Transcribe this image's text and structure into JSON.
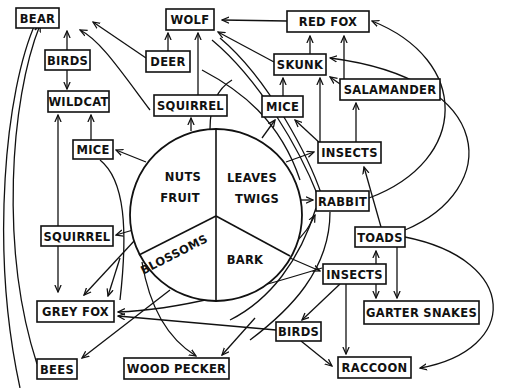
{
  "diagram": {
    "type": "food-web",
    "center": {
      "cx": 216,
      "cy": 215,
      "r": 86,
      "segments": [
        {
          "id": "nuts_fruit",
          "lines": [
            "NUTS",
            "FRUIT"
          ]
        },
        {
          "id": "leaves_twigs",
          "lines": [
            "LEAVES",
            "TWIGS"
          ]
        },
        {
          "id": "blossoms",
          "lines": [
            "BLOSSOMS"
          ]
        },
        {
          "id": "bark",
          "lines": [
            "BARK"
          ]
        }
      ]
    },
    "nodes": [
      {
        "id": "bear",
        "label": "BEAR",
        "x": 16,
        "y": 8,
        "w": 43,
        "h": 20
      },
      {
        "id": "wolf",
        "label": "WOLF",
        "x": 166,
        "y": 9,
        "w": 48,
        "h": 21
      },
      {
        "id": "red_fox",
        "label": "RED FOX",
        "x": 287,
        "y": 11,
        "w": 82,
        "h": 21
      },
      {
        "id": "birds_top",
        "label": "BIRDS",
        "x": 45,
        "y": 50,
        "w": 45,
        "h": 20
      },
      {
        "id": "deer",
        "label": "DEER",
        "x": 146,
        "y": 51,
        "w": 44,
        "h": 21
      },
      {
        "id": "skunk",
        "label": "SKUNK",
        "x": 274,
        "y": 54,
        "w": 52,
        "h": 21
      },
      {
        "id": "salamander",
        "label": "SALAMANDER",
        "x": 340,
        "y": 79,
        "w": 100,
        "h": 21
      },
      {
        "id": "wildcat",
        "label": "WILDCAT",
        "x": 48,
        "y": 91,
        "w": 61,
        "h": 21
      },
      {
        "id": "squirrel_top",
        "label": "SQUIRREL",
        "x": 154,
        "y": 95,
        "w": 73,
        "h": 21
      },
      {
        "id": "mice_top",
        "label": "MICE",
        "x": 262,
        "y": 96,
        "w": 41,
        "h": 21
      },
      {
        "id": "mice_left",
        "label": "MICE",
        "x": 73,
        "y": 140,
        "w": 40,
        "h": 19
      },
      {
        "id": "insects_top",
        "label": "INSECTS",
        "x": 318,
        "y": 142,
        "w": 63,
        "h": 21
      },
      {
        "id": "rabbit",
        "label": "RABBIT",
        "x": 316,
        "y": 191,
        "w": 53,
        "h": 20
      },
      {
        "id": "squirrel_left",
        "label": "SQUIRREL",
        "x": 41,
        "y": 226,
        "w": 72,
        "h": 20
      },
      {
        "id": "toads",
        "label": "TOADS",
        "x": 355,
        "y": 227,
        "w": 50,
        "h": 20
      },
      {
        "id": "insects_bottom",
        "label": "INSECTS",
        "x": 323,
        "y": 264,
        "w": 63,
        "h": 20
      },
      {
        "id": "grey_fox",
        "label": "GREY FOX",
        "x": 37,
        "y": 301,
        "w": 77,
        "h": 21
      },
      {
        "id": "garter_snakes",
        "label": "GARTER SNAKES",
        "x": 364,
        "y": 301,
        "w": 115,
        "h": 23
      },
      {
        "id": "birds_bottom",
        "label": "BIRDS",
        "x": 276,
        "y": 322,
        "w": 45,
        "h": 19
      },
      {
        "id": "bees",
        "label": "BEES",
        "x": 37,
        "y": 359,
        "w": 40,
        "h": 20
      },
      {
        "id": "wood_pecker",
        "label": "WOOD PECKER",
        "x": 124,
        "y": 358,
        "w": 105,
        "h": 21
      },
      {
        "id": "raccoon",
        "label": "RACCOON",
        "x": 338,
        "y": 357,
        "w": 73,
        "h": 21
      }
    ],
    "edges": [
      {
        "from": "birds_top",
        "to": "bear"
      },
      {
        "from": "birds_top",
        "to": "wildcat"
      },
      {
        "from": "deer",
        "to": "bear"
      },
      {
        "from": "deer",
        "to": "wolf"
      },
      {
        "from": "squirrel_top",
        "to": "wolf"
      },
      {
        "from": "red_fox",
        "to": "wolf"
      },
      {
        "from": "skunk",
        "to": "wolf"
      },
      {
        "from": "skunk",
        "to": "red_fox"
      },
      {
        "from": "salamander",
        "to": "red_fox"
      },
      {
        "from": "salamander",
        "to": "skunk"
      },
      {
        "from": "mice_top",
        "to": "skunk"
      },
      {
        "from": "insects_top",
        "to": "skunk"
      },
      {
        "from": "insects_top",
        "to": "salamander"
      },
      {
        "from": "insects_top",
        "to": "mice_top"
      },
      {
        "from": "mice_left",
        "to": "wildcat"
      },
      {
        "from": "squirrel_left",
        "to": "wildcat"
      },
      {
        "from": "squirrel_left",
        "to": "grey_fox"
      },
      {
        "from": "toads",
        "to": "insects_top"
      },
      {
        "from": "toads",
        "to": "garter_snakes"
      },
      {
        "from": "insects_bottom",
        "to": "toads"
      },
      {
        "from": "insects_bottom",
        "to": "garter_snakes"
      },
      {
        "from": "insects_bottom",
        "to": "birds_bottom"
      },
      {
        "from": "insects_bottom",
        "to": "raccoon"
      },
      {
        "from": "birds_bottom",
        "to": "raccoon"
      },
      {
        "from": "toads",
        "to": "raccoon"
      },
      {
        "from": "rabbit",
        "to": "red_fox"
      },
      {
        "from": "toads",
        "to": "skunk"
      },
      {
        "from": "bees",
        "to": "bear"
      },
      {
        "from": "center",
        "to": "mice_left"
      },
      {
        "from": "center",
        "to": "squirrel_left"
      },
      {
        "from": "center",
        "to": "grey_fox"
      },
      {
        "from": "center",
        "to": "squirrel_top"
      },
      {
        "from": "center",
        "to": "mice_top"
      },
      {
        "from": "center",
        "to": "insects_top"
      },
      {
        "from": "center",
        "to": "rabbit"
      },
      {
        "from": "center",
        "to": "insects_bottom"
      },
      {
        "from": "center",
        "to": "deer"
      },
      {
        "from": "center",
        "to": "bees"
      },
      {
        "from": "center",
        "to": "wood_pecker"
      },
      {
        "from": "insects_bottom",
        "to": "wood_pecker"
      },
      {
        "from": "birds_bottom",
        "to": "grey_fox"
      }
    ]
  }
}
